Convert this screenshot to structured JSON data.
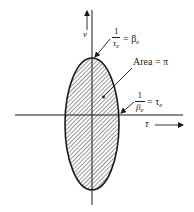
{
  "diagram": {
    "type": "ellipse-phase-space",
    "axes": {
      "vertical": {
        "label": "ν"
      },
      "horizontal": {
        "label": "τ"
      }
    },
    "ellipse": {
      "fill": "hatched",
      "area_label": "Area = π"
    },
    "annotations": {
      "top_intercept": {
        "numerator": "1",
        "denominator": "τ",
        "denominator_sub": "e",
        "equals": "= β",
        "equals_sub": "e"
      },
      "right_intercept": {
        "numerator": "1",
        "denominator": "β",
        "denominator_sub": "e",
        "equals": "= τ",
        "equals_sub": "e"
      },
      "area": "Area = π"
    },
    "colors": {
      "ink": "#1a1a1a",
      "background": "#ffffff"
    }
  }
}
